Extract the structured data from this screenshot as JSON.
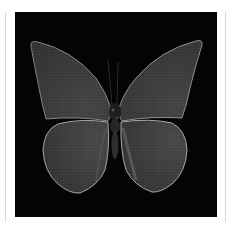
{
  "image": {
    "subject": "butterfly",
    "description": "Monochrome butterfly specimen with wings spread on black background, white framed",
    "colors": {
      "background": "#ffffff",
      "panel": "#040404",
      "wing_fill": "#3b3b3b",
      "wing_edge": "#bdbdbd",
      "body": "#262626",
      "frame_line": "#d6d6d6"
    }
  }
}
